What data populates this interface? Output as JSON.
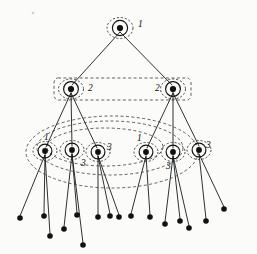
{
  "figure": {
    "type": "tree-diagram",
    "background_color": "#fbfbfa",
    "edge_color": "#1a1a1a",
    "node_color": "#111111",
    "group_outline_color": "#2b2b2b",
    "canvas": {
      "width": 257,
      "height": 254
    }
  },
  "labels": {
    "root": "1",
    "level2_left": "2",
    "level2_right": "2",
    "level3_a": "1",
    "level3_b": "3",
    "level3_c": "3",
    "level3_d": "1",
    "level3_e": "3",
    "level3_f": "3"
  },
  "nodes": {
    "root": {
      "id": "r",
      "label": "1",
      "x": 120,
      "y": 28,
      "level": 1
    },
    "level2": [
      {
        "id": "a",
        "label": "2",
        "x": 71,
        "y": 89,
        "level": 2
      },
      {
        "id": "b",
        "label": "2",
        "x": 173,
        "y": 89,
        "level": 2
      }
    ],
    "level3": [
      {
        "id": "a1",
        "label": "1",
        "x": 45,
        "y": 151,
        "level": 3
      },
      {
        "id": "a2",
        "label": "3",
        "x": 72,
        "y": 150,
        "level": 3
      },
      {
        "id": "a3",
        "label": "3",
        "x": 98,
        "y": 152,
        "level": 3
      },
      {
        "id": "b1",
        "label": "1",
        "x": 146,
        "y": 152,
        "level": 3
      },
      {
        "id": "b2",
        "label": "3",
        "x": 173,
        "y": 152,
        "level": 3
      },
      {
        "id": "b3",
        "label": "3",
        "x": 199,
        "y": 150,
        "level": 3
      }
    ],
    "leaves": [
      {
        "x": 20,
        "y": 218
      },
      {
        "x": 44,
        "y": 216
      },
      {
        "x": 50,
        "y": 236
      },
      {
        "x": 64,
        "y": 229
      },
      {
        "x": 77,
        "y": 215
      },
      {
        "x": 83,
        "y": 245
      },
      {
        "x": 98,
        "y": 217
      },
      {
        "x": 110,
        "y": 216
      },
      {
        "x": 119,
        "y": 217
      },
      {
        "x": 131,
        "y": 216
      },
      {
        "x": 150,
        "y": 217
      },
      {
        "x": 165,
        "y": 224
      },
      {
        "x": 180,
        "y": 221
      },
      {
        "x": 189,
        "y": 228
      },
      {
        "x": 206,
        "y": 221
      },
      {
        "x": 224,
        "y": 209
      }
    ]
  },
  "groups": {
    "node_rings_label": "solid ring around each internal node",
    "dashed_rings_label": "dashed ellipse around each internal node",
    "big_clusters": [
      {
        "name": "level2-span",
        "label": "2"
      },
      {
        "name": "level3-span-outer",
        "label": "1"
      },
      {
        "name": "level3-span-inner",
        "label": "3"
      }
    ]
  },
  "counts": {
    "internal_nodes": 9,
    "leaf_nodes": 16,
    "levels": 3
  }
}
